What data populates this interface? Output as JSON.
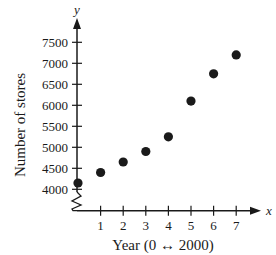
{
  "chart_data": {
    "type": "scatter",
    "title": "",
    "xlabel": "Year (0 ↔ 2000)",
    "ylabel": "Number of stores",
    "x_axis_var": "x",
    "y_axis_var": "y",
    "x": [
      0,
      1,
      2,
      3,
      4,
      5,
      6,
      7
    ],
    "y": [
      4150,
      4400,
      4650,
      4900,
      5250,
      6100,
      6750,
      7200
    ],
    "x_ticks": [
      "1",
      "2",
      "3",
      "4",
      "5",
      "6",
      "7"
    ],
    "y_ticks": [
      "4000",
      "4500",
      "5000",
      "5500",
      "6000",
      "6500",
      "7000",
      "7500"
    ],
    "xlim": [
      0,
      7.5
    ],
    "ylim": [
      4000,
      7500
    ],
    "y_axis_break": true,
    "grid": false,
    "legend": null,
    "marker_color": "#1a1a1a"
  }
}
